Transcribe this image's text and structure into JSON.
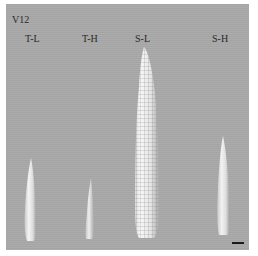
{
  "figure": {
    "stage_label": "V12",
    "background_color": "#a9a9a9",
    "specimens": [
      {
        "label": "T-L",
        "description": "tassel, low"
      },
      {
        "label": "T-H",
        "description": "tassel, high"
      },
      {
        "label": "S-L",
        "description": "silk/ear, low"
      },
      {
        "label": "S-H",
        "description": "silk/ear, high"
      }
    ],
    "scale_bar": "scale-bar"
  }
}
